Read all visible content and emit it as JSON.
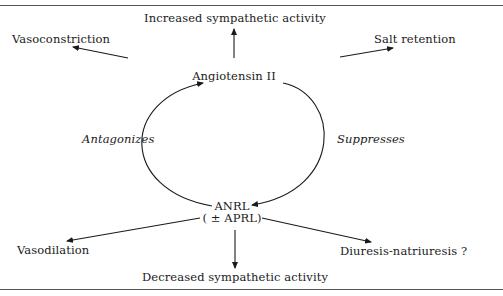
{
  "diagram": {
    "clipped_header_text": "…(partially clipped caption line)…",
    "center_top": {
      "label": "Angiotensin II"
    },
    "center_bottom": {
      "label": "ANRL",
      "sublabel": "( ± APRL)"
    },
    "cycle_labels": {
      "left": "Antagonizes",
      "right": "Suppresses"
    },
    "angiotensin_effects": [
      {
        "label": "Vasoconstriction",
        "direction": "up-left"
      },
      {
        "label": "Increased sympathetic activity",
        "direction": "up"
      },
      {
        "label": "Salt retention",
        "direction": "up-right"
      }
    ],
    "anrl_effects": [
      {
        "label": "Vasodilation",
        "direction": "down-left"
      },
      {
        "label": "Decreased sympathetic activity",
        "direction": "down"
      },
      {
        "label": "Diuresis-natriuresis ?",
        "direction": "down-right"
      }
    ],
    "colors": {
      "line": "#1a1a1a",
      "rule": "#555555",
      "background": "#ffffff"
    }
  }
}
